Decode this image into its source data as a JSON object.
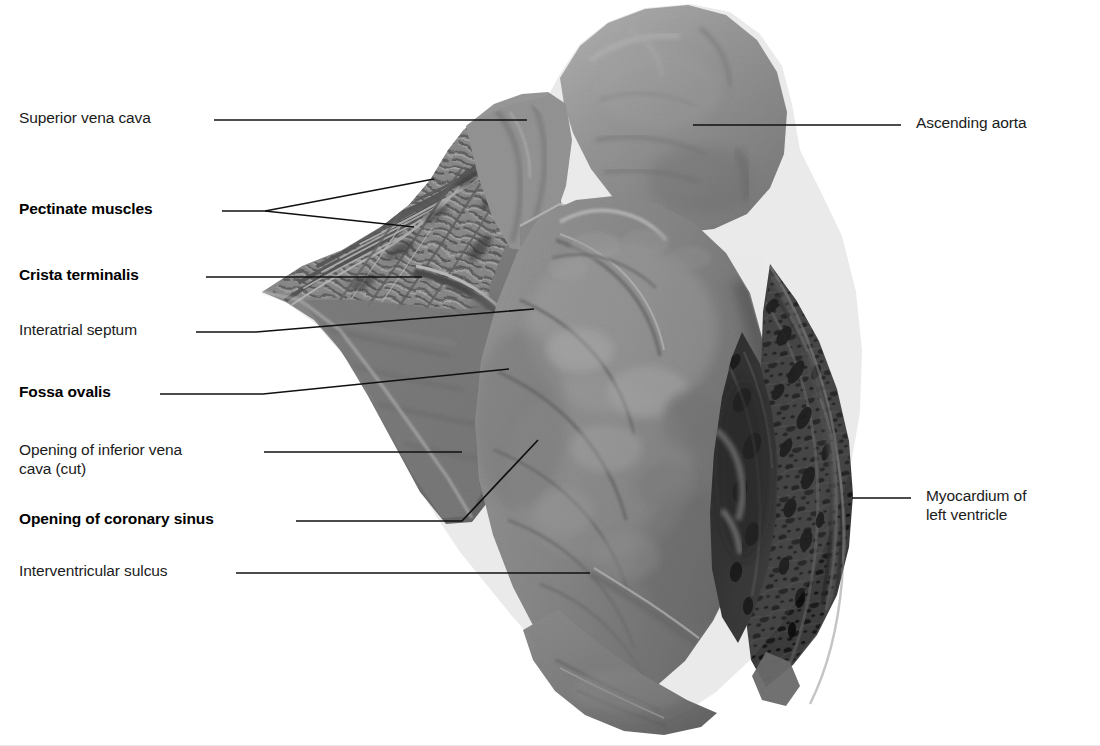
{
  "figure": {
    "background_color": "#ffffff",
    "leader_color": "#101010",
    "text_color": "#1b1b1b",
    "width": 1100,
    "height": 746
  },
  "labels": {
    "superior_vena_cava": "Superior vena cava",
    "pectinate_muscles": "Pectinate muscles",
    "crista_terminalis": "Crista terminalis",
    "interatrial_septum": "Interatrial septum",
    "fossa_ovalis": "Fossa ovalis",
    "opening_inferior_vena_cava": "Opening of inferior vena\ncava (cut)",
    "opening_coronary_sinus": "Opening of coronary sinus",
    "interventricular_sulcus": "Interventricular sulcus",
    "ascending_aorta": "Ascending aorta",
    "myocardium_left_ventricle": "Myocardium of\nleft ventricle"
  },
  "label_styles": {
    "superior_vena_cava": "regular",
    "pectinate_muscles": "bold",
    "crista_terminalis": "bold",
    "interatrial_septum": "regular",
    "fossa_ovalis": "bold",
    "opening_inferior_vena_cava": "regular",
    "opening_coronary_sinus": "bold",
    "interventricular_sulcus": "regular",
    "ascending_aorta": "regular",
    "myocardium_left_ventricle": "regular"
  },
  "specimen": {
    "name": "human heart dissection specimen",
    "tones": {
      "mid_grey": "#8d8d8d",
      "light_grey": "#b4b4b4",
      "dark_grey": "#4a4a4a",
      "very_dark": "#2a2a2a",
      "highlight": "#c9c9c9"
    }
  }
}
